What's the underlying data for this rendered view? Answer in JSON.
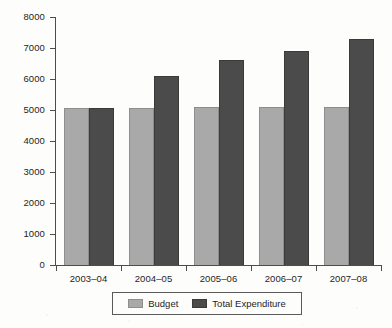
{
  "chart_data": {
    "type": "bar",
    "title": "",
    "subtitle": "",
    "xlabel": "",
    "ylabel": "",
    "ylim": [
      0,
      8000
    ],
    "y_ticks": [
      0,
      1000,
      2000,
      3000,
      4000,
      5000,
      6000,
      7000,
      8000
    ],
    "y_tick_labels": [
      "0",
      "1000",
      "2000",
      "3000",
      "4000",
      "5000",
      "6000",
      "7000",
      "8000"
    ],
    "grid": false,
    "legend_position": "bottom",
    "categories": [
      "2003–04",
      "2004–05",
      "2005–06",
      "2006–07",
      "2007–08"
    ],
    "series": [
      {
        "name": "Budget",
        "color": "#a9a9a9",
        "values": [
          5050,
          5070,
          5090,
          5100,
          5110
        ]
      },
      {
        "name": "Total Expenditure",
        "color": "#4b4b4b",
        "values": [
          5080,
          6100,
          6600,
          6900,
          7300
        ]
      }
    ]
  },
  "legend": {
    "entries": [
      {
        "label": "Budget",
        "swatch": "budget-swatch"
      },
      {
        "label": "Total Expenditure",
        "swatch": "expenditure-swatch"
      }
    ]
  }
}
